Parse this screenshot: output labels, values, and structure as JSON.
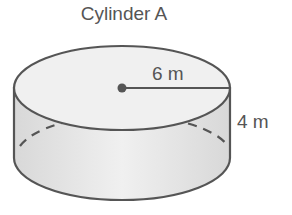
{
  "diagram": {
    "title": "Cylinder A",
    "radius_label": "6 m",
    "height_label": "4 m",
    "colors": {
      "stroke": "#555555",
      "top_fill": "#efefef",
      "side_fill": "#e2e2e2",
      "text": "#555555"
    }
  }
}
